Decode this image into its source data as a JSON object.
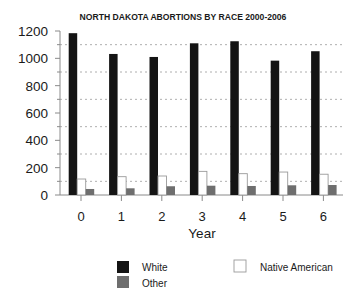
{
  "chart_data": {
    "type": "bar",
    "title": "NORTH DAKOTA ABORTIONS BY RACE 2000-2006",
    "xlabel": "Year",
    "ylabel": "",
    "categories": [
      "0",
      "1",
      "2",
      "3",
      "4",
      "5",
      "6"
    ],
    "series": [
      {
        "name": "White",
        "color": "#141414",
        "values": [
          1184,
          1032,
          1010,
          1110,
          1125,
          983,
          1052
        ]
      },
      {
        "name": "Native American",
        "color": "#ffffff",
        "values": [
          117,
          134,
          139,
          173,
          156,
          168,
          152
        ]
      },
      {
        "name": "Other",
        "color": "#6e6e6e",
        "values": [
          44,
          49,
          64,
          68,
          66,
          71,
          73
        ]
      }
    ],
    "ylim": [
      0,
      1200
    ],
    "yticks": [
      0,
      200,
      400,
      600,
      800,
      1000,
      1200
    ],
    "ytick_labels": [
      "0",
      "200",
      "400",
      "600",
      "800",
      "1000",
      "1200"
    ],
    "minor_yticks": [
      100,
      300,
      500,
      700,
      900,
      1100
    ],
    "grid": {
      "on": true,
      "style": "dotted",
      "at": [
        100,
        300,
        500,
        700,
        900,
        1100
      ],
      "color": "#9a9a9a"
    },
    "legend": {
      "position": "bottom",
      "entries": [
        {
          "label": "White",
          "color": "#141414"
        },
        {
          "label": "Native American",
          "color": "#ffffff"
        },
        {
          "label": "Other",
          "color": "#6e6e6e"
        }
      ]
    }
  }
}
